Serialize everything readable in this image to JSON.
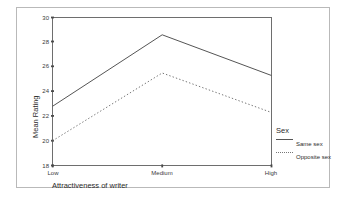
{
  "chart_data": {
    "type": "line",
    "title": "",
    "xlabel": "Attractiveness of writer",
    "ylabel": "Mean Rating",
    "categories": [
      "Low",
      "Medium",
      "High"
    ],
    "ylim": [
      18,
      30
    ],
    "yticks": [
      18,
      20,
      22,
      24,
      26,
      28,
      30
    ],
    "ytick_labels": [
      "18",
      "20",
      "22",
      "24",
      "26",
      "28",
      "30"
    ],
    "grid": false,
    "legend_position": "right",
    "legend_title": "Sex",
    "series": [
      {
        "name": "Same sex",
        "style": "solid",
        "color": "#555555",
        "values": [
          22.8,
          28.6,
          25.3
        ]
      },
      {
        "name": "Opposite sex",
        "style": "dotted",
        "color": "#777777",
        "values": [
          20.0,
          25.5,
          22.3
        ]
      }
    ]
  },
  "axes": {
    "y_title": "Mean Rating",
    "x_title": "Attractiveness of writer",
    "y_tick_0": "18",
    "y_tick_1": "20",
    "y_tick_2": "22",
    "y_tick_3": "24",
    "y_tick_4": "26",
    "y_tick_5": "28",
    "y_tick_6": "30",
    "x_tick_0": "Low",
    "x_tick_1": "Medium",
    "x_tick_2": "High"
  },
  "legend": {
    "title": "Sex",
    "entry_0": "Same sex",
    "entry_1": "Opposite sex"
  },
  "colors": {
    "frame": "#b9b9b9",
    "axis": "#6e6e6e",
    "same_sex": "#555555",
    "opposite_sex": "#777777",
    "text": "#2b2b2b",
    "background": "#ffffff"
  }
}
